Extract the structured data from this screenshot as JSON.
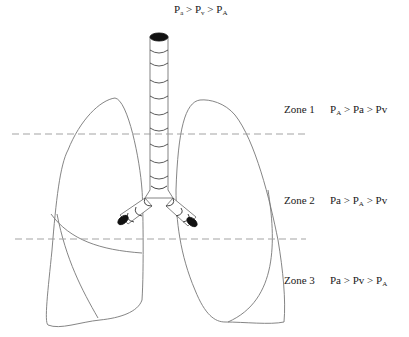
{
  "title": {
    "parts": [
      "P",
      "a",
      " > P",
      "v",
      " > P",
      "A"
    ]
  },
  "zones": [
    {
      "name": "Zone 1",
      "relation": [
        "P",
        "A",
        " > Pa  > Pv"
      ],
      "top": 103
    },
    {
      "name": "Zone 2",
      "relation": [
        "Pa  > P",
        "A",
        " > Pv"
      ],
      "top": 194
    },
    {
      "name": "Zone 3",
      "relation": [
        "Pa  > Pv  > P",
        "A",
        ""
      ],
      "top": 274
    }
  ],
  "diagram": {
    "divider_lines": [
      {
        "y": 134,
        "x1": 12,
        "x2": 306,
        "style": "dashed"
      },
      {
        "y": 239,
        "x1": 15,
        "x2": 306,
        "style": "dashed"
      }
    ],
    "colors": {
      "line": "#777777",
      "trachea_fill": "#111111",
      "dash": "#999999"
    }
  }
}
